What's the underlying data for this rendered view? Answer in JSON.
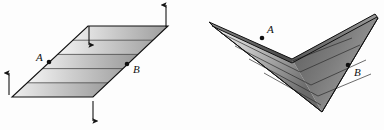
{
  "figure": {
    "background_color": "#fdfdfd",
    "stroke_color": "#1a1a1a",
    "panels": [
      {
        "name": "flat-sheet",
        "caption": "",
        "points": [
          {
            "id": "A",
            "label": "A",
            "x": 49,
            "y": 62,
            "label_x": 36,
            "label_y": 61
          },
          {
            "id": "B",
            "label": "B",
            "x": 127,
            "y": 64,
            "label_x": 133,
            "label_y": 73
          }
        ],
        "arrows": [
          {
            "name": "arrow-left-up",
            "direction": "up",
            "x": 9,
            "y1": 95,
            "y2": 72
          },
          {
            "name": "arrow-bottom-down",
            "direction": "down",
            "x": 93,
            "y1": 101,
            "y2": 122
          },
          {
            "name": "arrow-inner-down",
            "direction": "down",
            "x": 89,
            "y1": 26,
            "y2": 46
          },
          {
            "name": "arrow-top-right-up",
            "direction": "up",
            "x": 166,
            "y1": 27,
            "y2": 4
          }
        ],
        "strip_count": 5
      },
      {
        "name": "bent-sheet",
        "caption": "",
        "points": [
          {
            "id": "A",
            "label": "A",
            "x": 262,
            "y": 38,
            "label_x": 267,
            "label_y": 34
          },
          {
            "id": "B",
            "label": "B",
            "x": 348,
            "y": 65,
            "label_x": 354,
            "label_y": 75
          }
        ],
        "arrows": [],
        "strip_count": 5
      }
    ],
    "shading": {
      "light": "#f2f2f2",
      "mid": "#b4b4b4",
      "dark": "#6e6e6e",
      "darkest": "#4a4a4a"
    },
    "labels": {
      "point_a": "A",
      "point_b": "B"
    }
  }
}
